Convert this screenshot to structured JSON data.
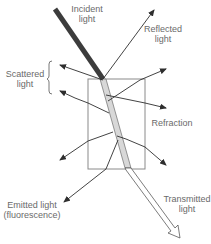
{
  "diagram": {
    "labels": {
      "incident": [
        "Incident",
        "light"
      ],
      "reflected": [
        "Reflected",
        "light"
      ],
      "scattered": [
        "Scattered",
        "light"
      ],
      "refraction": "Refraction",
      "emitted": [
        "Emitted light",
        "(fluorescence)"
      ],
      "transmitted": [
        "Transmitted",
        "light"
      ]
    },
    "colors": {
      "incident_beam": "#3c3c3c",
      "refracted_beam": "#d8d8d8",
      "lines": "#2e2e2e",
      "box": "#8a8a8a",
      "text": "#6a6a6a"
    }
  }
}
